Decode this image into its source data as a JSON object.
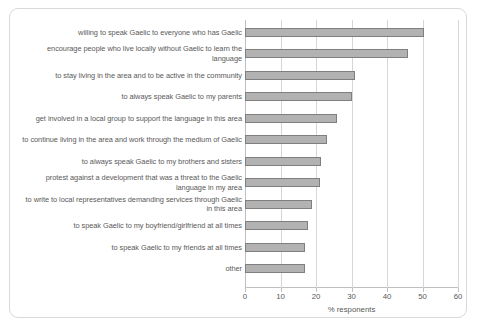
{
  "chart_data": {
    "type": "bar",
    "orientation": "horizontal",
    "title": "",
    "xlabel": "% responents",
    "ylabel": "",
    "xlim": [
      0,
      60
    ],
    "xticks": [
      0,
      10,
      20,
      30,
      40,
      50,
      60
    ],
    "grid": true,
    "legend": false,
    "bar_fill_color": "#b2b2b2",
    "bar_border_color": "#7f7f7f",
    "categories": [
      "willing to speak Gaelic to everyone who has Gaelic",
      "encourage people who live locally without Gaelic to learn the language",
      "to stay living in the area and to be active in the community",
      "to always speak Gaelic to my parents",
      "get involved in a local group to support the language in this area",
      "to continue living in the area and work through the medium of Gaelic",
      "to always speak Gaelic to my brothers and sisters",
      "protest against a development that was a threat to the Gaelic language in my area",
      "to write to local representatives demanding services through Gaelic in this area",
      "to speak Gaelic to my boyfriend/girlfriend at all times",
      "to speak Gaelic to my friends at all times",
      "other"
    ],
    "values": [
      50.5,
      45.9,
      31.0,
      30.0,
      26.0,
      23.0,
      21.5,
      21.0,
      18.8,
      17.8,
      17.0,
      17.0
    ]
  }
}
